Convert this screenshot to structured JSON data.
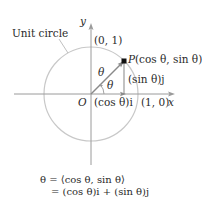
{
  "diagram": {
    "title": "Unit circle",
    "circle_label": "Unit circle",
    "axes": {
      "x_label": "x",
      "y_label": "y",
      "origin_label": "O",
      "point_x_intercept": "(1, 0)",
      "point_y_intercept": "(0, 1)"
    },
    "point": {
      "name": "P",
      "coords": "(cos θ, sin θ)"
    },
    "angle_label": "θ",
    "vector_label": "θ",
    "components": {
      "horizontal": "(cos θ)i",
      "vertical": "(sin θ)j"
    },
    "equations": {
      "line1": "θ = ⟨cos θ, sin θ⟩",
      "line2": "= (cos θ)i + (sin θ)j"
    },
    "colors": {
      "circle": "#c8c8c8",
      "axes": "#9a9a9a",
      "vector": "#8a8a8a",
      "point": "#111111",
      "text": "#2a2a2a"
    }
  }
}
